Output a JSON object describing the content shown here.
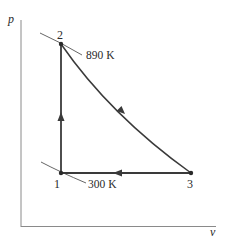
{
  "diagram": {
    "type": "p-v cycle diagram",
    "axes": {
      "y_label": "p",
      "x_label": "v"
    },
    "states": [
      {
        "id": "1",
        "label": "1",
        "temperature": "300 K"
      },
      {
        "id": "2",
        "label": "2",
        "temperature": "890 K"
      },
      {
        "id": "3",
        "label": "3"
      }
    ],
    "processes": [
      {
        "from": "1",
        "to": "2",
        "shape": "vertical line (constant volume)",
        "direction": "up"
      },
      {
        "from": "2",
        "to": "3",
        "shape": "curve (expansion)",
        "direction": "down-right"
      },
      {
        "from": "3",
        "to": "1",
        "shape": "horizontal line (constant pressure)",
        "direction": "left"
      }
    ],
    "isotherm_labels": {
      "high": "890 K",
      "low": "300 K"
    },
    "colors": {
      "line": "#3a3a3a",
      "axis": "#8a8a8a",
      "isotherm": "#555555"
    }
  }
}
